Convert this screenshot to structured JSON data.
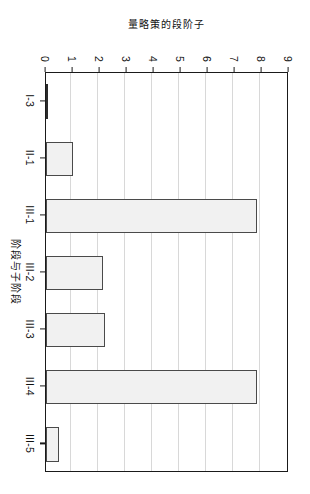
{
  "chart_data": {
    "type": "bar",
    "orientation": "vertical-rotated-90",
    "title": "",
    "subtitle": "",
    "xlabel": "阶段与子阶段",
    "ylabel": "量略策的段阶子",
    "categories": [
      "I-3",
      "II-1",
      "III-1",
      "III-2",
      "III-3",
      "III-4",
      "III-5"
    ],
    "values": [
      0,
      1.0,
      7.8,
      2.1,
      2.2,
      7.8,
      0.5
    ],
    "series": [
      {
        "name": "策略数量",
        "values": [
          0,
          1.0,
          7.8,
          2.1,
          2.2,
          7.8,
          0.5
        ]
      }
    ],
    "ylim": [
      0,
      9
    ],
    "yticks": [
      0,
      1,
      2,
      3,
      4,
      5,
      6,
      7,
      8,
      9
    ],
    "ytick_labels": [
      "0",
      "1",
      "2",
      "3",
      "4",
      "5",
      "6",
      "7",
      "8",
      "9"
    ],
    "grid": true,
    "grid_axis": "y",
    "legend": false,
    "legend_position": "none",
    "bar_fill_color": "#f1f1f1",
    "bar_border_color": "#4a4a4a",
    "axis_color": "#1a1a1a",
    "grid_color": "#d8d8d8",
    "background_color": "#ffffff"
  }
}
